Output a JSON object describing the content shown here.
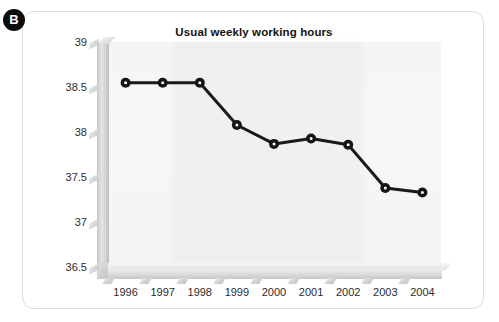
{
  "panel": {
    "badge_label": "B"
  },
  "chart_data": {
    "type": "line",
    "title": "Usual weekly working hours",
    "xlabel": "",
    "ylabel": "",
    "categories": [
      "1996",
      "1997",
      "1998",
      "1999",
      "2000",
      "2001",
      "2002",
      "2003",
      "2004"
    ],
    "values": [
      38.57,
      38.57,
      38.57,
      38.1,
      37.89,
      37.95,
      37.88,
      37.4,
      37.35
    ],
    "series": [
      {
        "name": "Usual weekly working hours",
        "values": [
          38.57,
          38.57,
          38.57,
          38.1,
          37.89,
          37.95,
          37.88,
          37.4,
          37.35
        ]
      }
    ],
    "ylim": [
      36.5,
      39.0
    ],
    "ytick_labels": [
      "39",
      "38.5",
      "38",
      "37.5",
      "37",
      "36.5"
    ],
    "ytick_values": [
      39,
      38.5,
      38,
      37.5,
      37,
      36.5
    ],
    "grid": false,
    "legend": "none",
    "marker": "filled-circle",
    "line_color": "#1a1a1a",
    "marker_color": "#141414",
    "plot_background": "#f3f3f3",
    "axis_color": "#d2d2d2"
  }
}
